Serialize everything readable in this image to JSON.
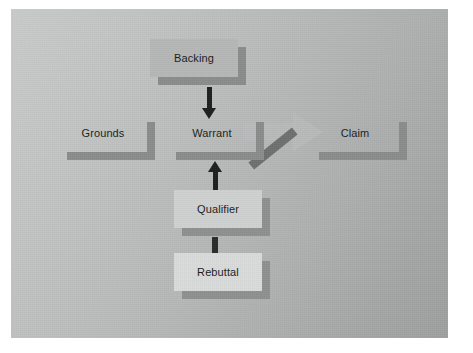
{
  "slide": {
    "title_visible": false,
    "background_color": "#b9bbbb",
    "page_background": "#ffffff"
  },
  "diagram": {
    "name": "toulmin-argument-model",
    "type": "flow-diagram",
    "boxes": [
      {
        "id": "backing",
        "label": "Backing",
        "x": 150,
        "y": 39,
        "w": 96,
        "h": 46,
        "tone": "mid"
      },
      {
        "id": "grounds",
        "label": "Grounds",
        "x": 59,
        "y": 114,
        "w": 96,
        "h": 46,
        "tone": "flat"
      },
      {
        "id": "warrant",
        "label": "Warrant",
        "x": 168,
        "y": 114,
        "w": 96,
        "h": 46,
        "tone": "flat"
      },
      {
        "id": "claim",
        "label": "Claim",
        "x": 311,
        "y": 114,
        "w": 96,
        "h": 46,
        "tone": "flat"
      },
      {
        "id": "qualifier",
        "label": "Qualifier",
        "x": 174,
        "y": 190,
        "w": 96,
        "h": 46,
        "tone": "light"
      },
      {
        "id": "rebuttal",
        "label": "Rebuttal",
        "x": 174,
        "y": 253,
        "w": 96,
        "h": 46,
        "tone": "lighter"
      }
    ],
    "connectors": [
      {
        "id": "backing-to-warrant",
        "from": "backing",
        "to": "warrant",
        "style": "arrow-down",
        "arrowhead": true
      },
      {
        "id": "qualifier-to-warrant",
        "from": "qualifier",
        "to": "warrant",
        "style": "arrow-up",
        "arrowhead": true
      },
      {
        "id": "rebuttal-to-qualifier",
        "from": "rebuttal",
        "to": "qualifier",
        "style": "bar",
        "arrowhead": false
      },
      {
        "id": "warrant-to-claim",
        "from": "warrant",
        "to": "claim",
        "style": "ghost-arrow",
        "arrowhead": true
      },
      {
        "id": "diagonal-slash",
        "from": "warrant",
        "to": "claim",
        "style": "slash",
        "arrowhead": false
      }
    ],
    "colors": {
      "box_face_mid": "#b5b7b7",
      "box_face_light": "#cfd1d0",
      "box_face_lighter": "#d9dbda",
      "box_shadow": "#8a8c8c",
      "connector": "#1e1e1e",
      "slash": "#6e7070",
      "text": "#1b1b1b"
    }
  }
}
